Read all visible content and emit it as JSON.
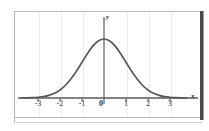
{
  "figure": {
    "background_color": "#ffffff",
    "frame_color": "#b9b9b9",
    "gridline_color": "#ededed",
    "curve_color": "#5a5a5a",
    "axis_color": "#5a5a5a",
    "x_axis_name": "x",
    "y_axis_name": "y"
  },
  "chart_data": {
    "type": "line",
    "title": "",
    "subtitle": "",
    "xlabel": "x",
    "ylabel": "y",
    "legend": [],
    "legend_position": "none",
    "grid": true,
    "grid_axis": "x",
    "xlim": [
      -3.75,
      3.75
    ],
    "ylim": [
      0,
      0.46
    ],
    "xticks": [
      -3,
      -2,
      -1,
      0,
      1,
      2,
      3
    ],
    "xtick_labels": [
      "-3",
      "-2",
      "-1",
      "0",
      "1",
      "2",
      "3"
    ],
    "yticks": [],
    "ytick_labels": [],
    "annotations": [],
    "series": [
      {
        "name": "standard normal density",
        "x": [
          -3.75,
          -3.5,
          -3.25,
          -3.0,
          -2.75,
          -2.5,
          -2.25,
          -2.0,
          -1.75,
          -1.5,
          -1.25,
          -1.0,
          -0.75,
          -0.5,
          -0.25,
          0.0,
          0.25,
          0.5,
          0.75,
          1.0,
          1.25,
          1.5,
          1.75,
          2.0,
          2.25,
          2.5,
          2.75,
          3.0,
          3.25,
          3.5,
          3.75
        ],
        "y": [
          0.0004,
          0.0009,
          0.002,
          0.0044,
          0.0091,
          0.0175,
          0.0317,
          0.054,
          0.0863,
          0.1295,
          0.1826,
          0.242,
          0.3011,
          0.3521,
          0.3867,
          0.3989,
          0.3867,
          0.3521,
          0.3011,
          0.242,
          0.1826,
          0.1295,
          0.0863,
          0.054,
          0.0317,
          0.0175,
          0.0091,
          0.0044,
          0.002,
          0.0009,
          0.0004
        ]
      }
    ]
  },
  "tick_labels": {
    "t0": "-3",
    "t1": "-2",
    "t2": "-1",
    "t3": "0",
    "t4": "1",
    "t5": "2",
    "t6": "3"
  },
  "axis_names": {
    "x": "x",
    "y": "y"
  }
}
